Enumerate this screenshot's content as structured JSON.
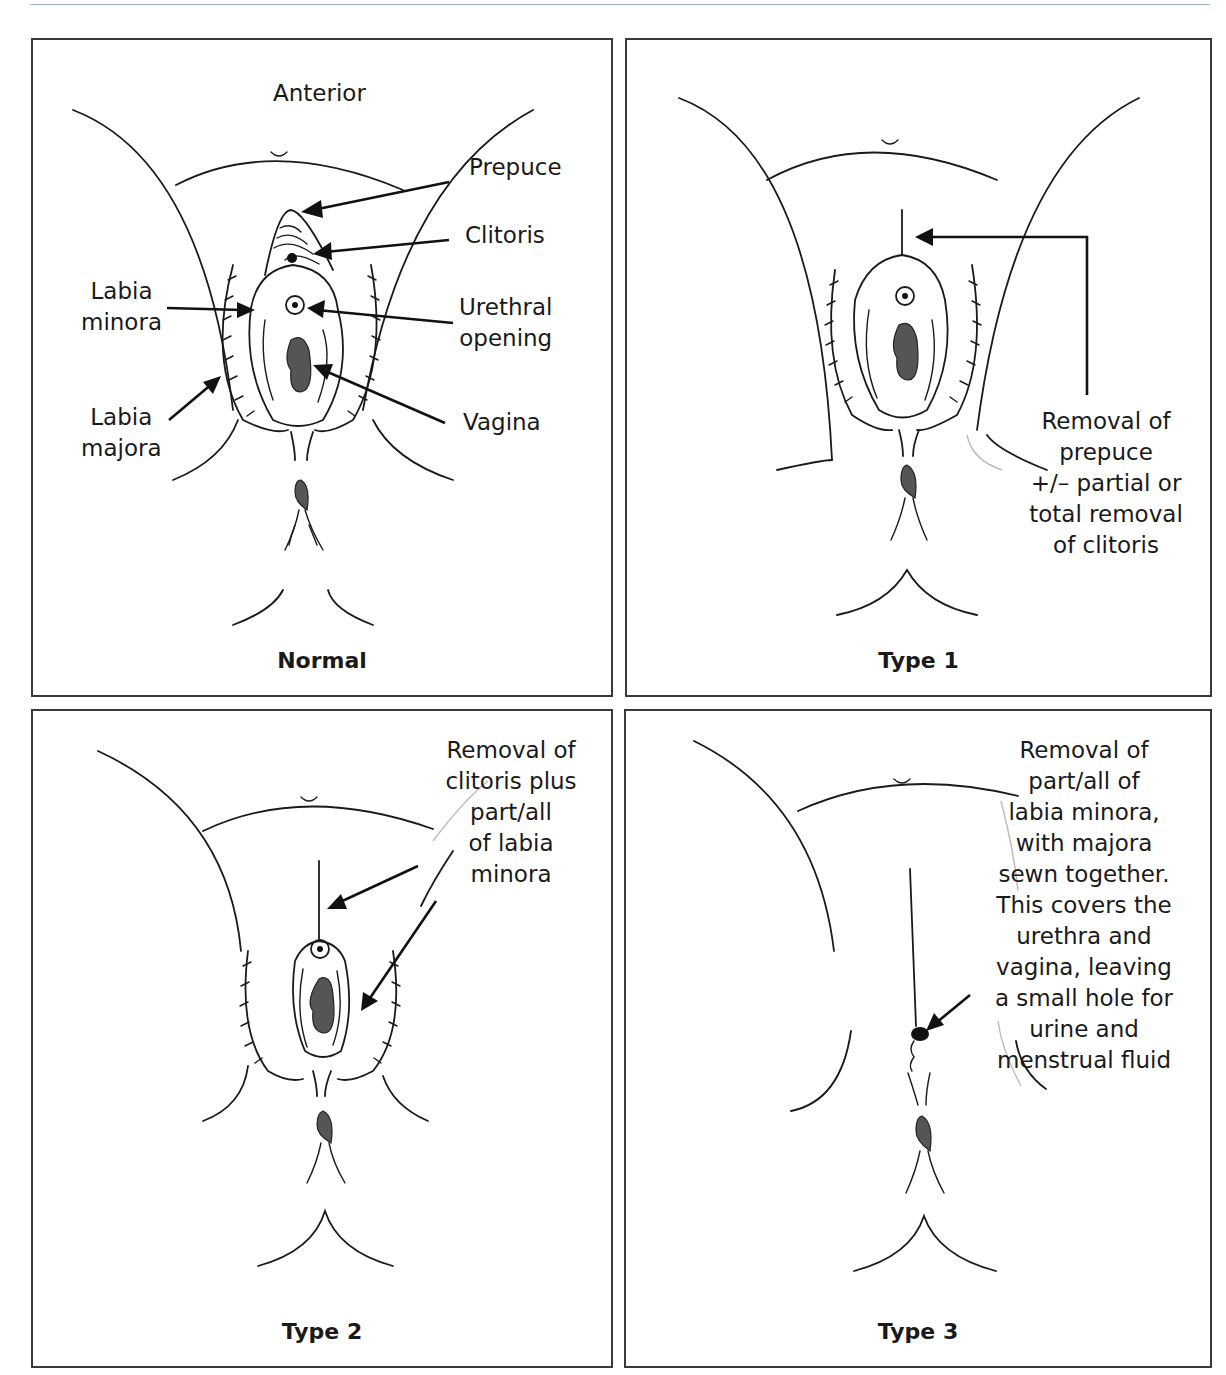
{
  "figure": {
    "panels": [
      {
        "id": "normal",
        "caption": "Normal",
        "labels": {
          "anterior": "Anterior",
          "prepuce": "Prepuce",
          "clitoris": "Clitoris",
          "urethral_opening": "Urethral\nopening",
          "vagina": "Vagina",
          "labia_minora": "Labia\nminora",
          "labia_majora": "Labia\nmajora"
        }
      },
      {
        "id": "type1",
        "caption": "Type 1",
        "annotation": "Removal of\nprepuce\n+/– partial or\ntotal removal\nof clitoris"
      },
      {
        "id": "type2",
        "caption": "Type 2",
        "annotation": "Removal of\nclitoris plus\npart/all\nof labia\nminora"
      },
      {
        "id": "type3",
        "caption": "Type 3",
        "annotation": "Removal of\npart/all of\nlabia minora,\nwith majora\nsewn together.\nThis covers the\nurethra and\nvagina, leaving\na small hole for\nurine and\nmenstrual fluid"
      }
    ],
    "colors": {
      "line": "#1a1a1a",
      "fill_dark": "#555555",
      "border": "#3a3a3a",
      "header_rule": "#9ab3b8"
    }
  }
}
